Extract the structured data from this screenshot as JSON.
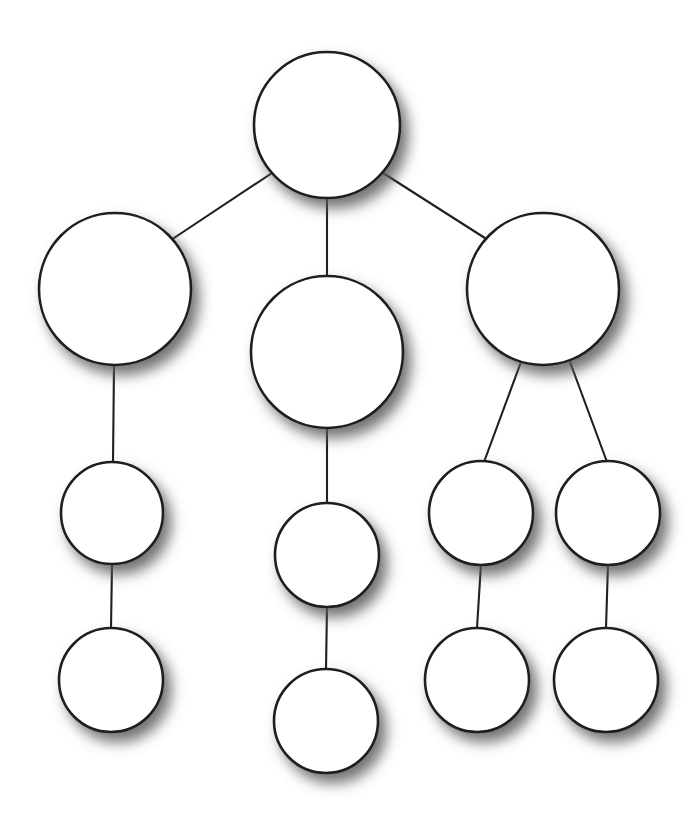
{
  "diagram": {
    "type": "tree",
    "canvas": {
      "width": 700,
      "height": 823,
      "background": "#ffffff"
    },
    "style": {
      "node_fill": "#ffffff",
      "node_stroke": "#231f20",
      "node_stroke_width": 2.6,
      "edge_stroke": "#231f20",
      "edge_stroke_width": 2.1,
      "shadow_color": "#6f6f6f",
      "shadow_offset_x": 7,
      "shadow_offset_y": 9,
      "shadow_blur": 9
    },
    "nodes": [
      {
        "id": "root",
        "label": "",
        "cx": 327,
        "cy": 125,
        "r": 73,
        "level": 0,
        "branch": "root"
      },
      {
        "id": "l1",
        "label": "",
        "cx": 115,
        "cy": 289,
        "r": 76,
        "level": 1,
        "branch": "left"
      },
      {
        "id": "m1",
        "label": "",
        "cx": 327,
        "cy": 352,
        "r": 76,
        "level": 1,
        "branch": "middle"
      },
      {
        "id": "r1",
        "label": "",
        "cx": 543,
        "cy": 289,
        "r": 76,
        "level": 1,
        "branch": "right"
      },
      {
        "id": "l2",
        "label": "",
        "cx": 112,
        "cy": 513,
        "r": 51,
        "level": 2,
        "branch": "left"
      },
      {
        "id": "m2",
        "label": "",
        "cx": 327,
        "cy": 555,
        "r": 52,
        "level": 2,
        "branch": "middle"
      },
      {
        "id": "r2a",
        "label": "",
        "cx": 481,
        "cy": 513,
        "r": 52,
        "level": 2,
        "branch": "right"
      },
      {
        "id": "r2b",
        "label": "",
        "cx": 608,
        "cy": 513,
        "r": 52,
        "level": 2,
        "branch": "right"
      },
      {
        "id": "l3",
        "label": "",
        "cx": 111,
        "cy": 680,
        "r": 52,
        "level": 3,
        "branch": "left"
      },
      {
        "id": "m3",
        "label": "",
        "cx": 326,
        "cy": 721,
        "r": 52,
        "level": 3,
        "branch": "middle"
      },
      {
        "id": "r3a",
        "label": "",
        "cx": 477,
        "cy": 680,
        "r": 52,
        "level": 3,
        "branch": "right"
      },
      {
        "id": "r3b",
        "label": "",
        "cx": 606,
        "cy": 680,
        "r": 52,
        "level": 3,
        "branch": "right"
      }
    ],
    "edges": [
      {
        "id": "edge-root-l1",
        "from": "root",
        "to": "l1",
        "x1": 272,
        "y1": 173,
        "x2": 171,
        "y2": 240
      },
      {
        "id": "edge-root-m1",
        "from": "root",
        "to": "m1",
        "x1": 327,
        "y1": 198,
        "x2": 327,
        "y2": 277
      },
      {
        "id": "edge-root-r1",
        "from": "root",
        "to": "r1",
        "x1": 383,
        "y1": 173,
        "x2": 488,
        "y2": 240
      },
      {
        "id": "edge-l1-l2",
        "from": "l1",
        "to": "l2",
        "x1": 114,
        "y1": 365,
        "x2": 113,
        "y2": 462
      },
      {
        "id": "edge-l2-l3",
        "from": "l2",
        "to": "l3",
        "x1": 112,
        "y1": 564,
        "x2": 111,
        "y2": 628
      },
      {
        "id": "edge-m1-m2",
        "from": "m1",
        "to": "m2",
        "x1": 327,
        "y1": 428,
        "x2": 327,
        "y2": 503
      },
      {
        "id": "edge-m2-m3",
        "from": "m2",
        "to": "m3",
        "x1": 327,
        "y1": 607,
        "x2": 326,
        "y2": 669
      },
      {
        "id": "edge-r1-r2a",
        "from": "r1",
        "to": "r2a",
        "x1": 521,
        "y1": 362,
        "x2": 484,
        "y2": 462
      },
      {
        "id": "edge-r1-r2b",
        "from": "r1",
        "to": "r2b",
        "x1": 570,
        "y1": 362,
        "x2": 607,
        "y2": 462
      },
      {
        "id": "edge-r2a-r3a",
        "from": "r2a",
        "to": "r3a",
        "x1": 481,
        "y1": 564,
        "x2": 477,
        "y2": 628
      },
      {
        "id": "edge-r2b-r3b",
        "from": "r2b",
        "to": "r3b",
        "x1": 608,
        "y1": 564,
        "x2": 606,
        "y2": 628
      }
    ]
  }
}
